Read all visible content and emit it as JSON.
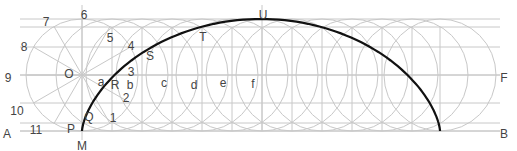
{
  "diagram": {
    "type": "cycloid-construction",
    "colors": {
      "construction": "#c8c8c8",
      "curve": "#111111",
      "label": "#444444"
    },
    "generating_circle": {
      "center_label": "O",
      "cx": 82,
      "cy": 75,
      "r": 56
    },
    "rolling_circle_centers_x": [
      82,
      112,
      142,
      172,
      202,
      232,
      262,
      292,
      322,
      352,
      382,
      412,
      440
    ],
    "horizontal_lines_y": [
      19,
      27,
      47,
      75,
      103,
      123,
      131
    ],
    "vertical_lines_x": [
      112,
      142,
      172,
      202,
      232,
      262,
      292,
      322,
      352,
      382,
      412,
      440
    ],
    "labels": {
      "division_points": [
        {
          "text": "1",
          "x": 113,
          "y": 119
        },
        {
          "text": "2",
          "x": 126,
          "y": 99
        },
        {
          "text": "3",
          "x": 131,
          "y": 73
        },
        {
          "text": "4",
          "x": 131,
          "y": 47
        },
        {
          "text": "5",
          "x": 110,
          "y": 39
        },
        {
          "text": "6",
          "x": 84,
          "y": 16
        },
        {
          "text": "7",
          "x": 46,
          "y": 23
        },
        {
          "text": "8",
          "x": 24,
          "y": 48
        },
        {
          "text": "9",
          "x": 8,
          "y": 79
        },
        {
          "text": "10",
          "x": 17,
          "y": 112
        },
        {
          "text": "11",
          "x": 36,
          "y": 131
        }
      ],
      "curve_points": [
        {
          "text": "M",
          "x": 82,
          "y": 147
        },
        {
          "text": "P",
          "x": 71,
          "y": 130
        },
        {
          "text": "Q",
          "x": 89,
          "y": 118
        },
        {
          "text": "R",
          "x": 115,
          "y": 86
        },
        {
          "text": "S",
          "x": 150,
          "y": 57
        },
        {
          "text": "T",
          "x": 203,
          "y": 38
        },
        {
          "text": "U",
          "x": 263,
          "y": 16
        }
      ],
      "centers": [
        {
          "text": "O",
          "x": 69,
          "y": 75
        },
        {
          "text": "a",
          "x": 101,
          "y": 83
        },
        {
          "text": "b",
          "x": 130,
          "y": 86
        },
        {
          "text": "c",
          "x": 164,
          "y": 84
        },
        {
          "text": "d",
          "x": 194,
          "y": 86
        },
        {
          "text": "e",
          "x": 223,
          "y": 84
        },
        {
          "text": "f",
          "x": 253,
          "y": 85
        }
      ],
      "line_ends": [
        {
          "text": "A",
          "x": 7,
          "y": 135
        },
        {
          "text": "B",
          "x": 504,
          "y": 135
        },
        {
          "text": "F",
          "x": 504,
          "y": 79
        }
      ]
    }
  }
}
